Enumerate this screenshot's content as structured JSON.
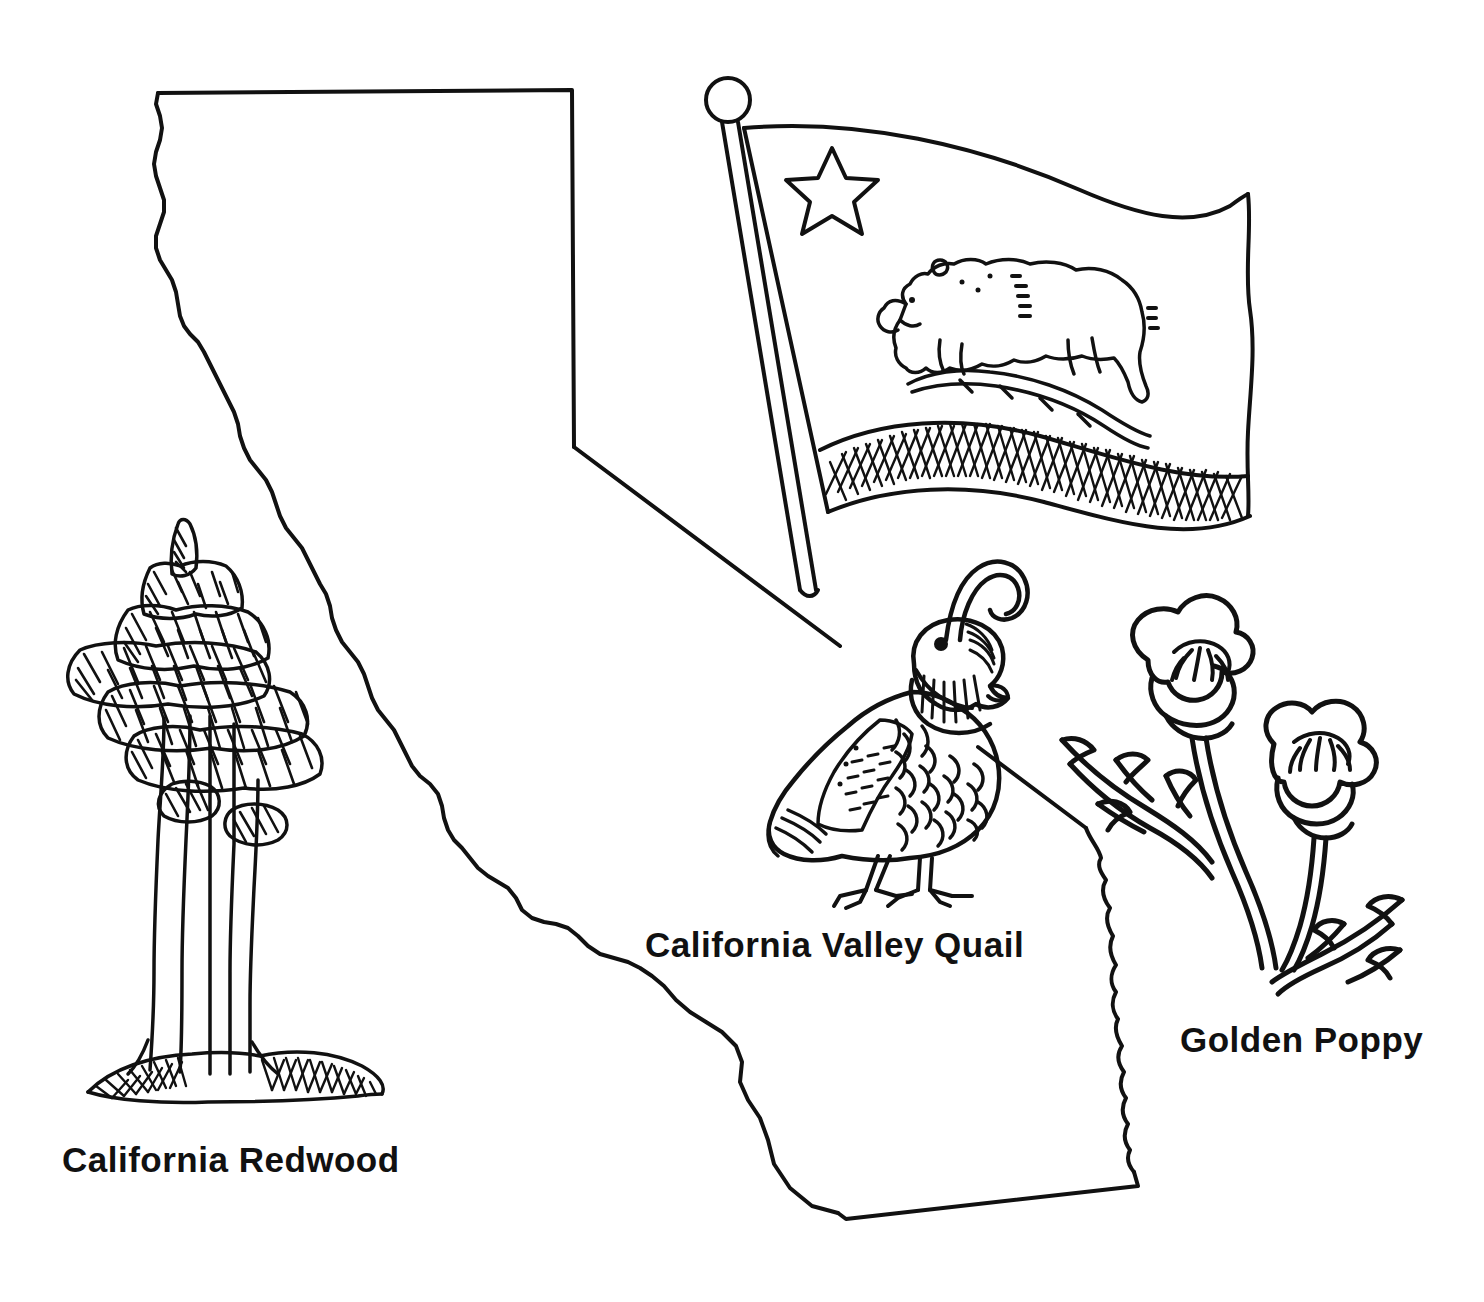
{
  "page": {
    "background_color": "#ffffff",
    "ink_color": "#111111",
    "width": 1484,
    "height": 1302,
    "style": "black-and-white line art / coloring page"
  },
  "map": {
    "state_name": "California",
    "outline_description": "Outline of the state of California with straight northern border, vertical eastern border, diagonal Nevada border, jagged Colorado River eastern edge, angled southern border and wavy Pacific coastline",
    "stroke_color": "#111111"
  },
  "labels": {
    "redwood": "California Redwood",
    "quail": "California Valley Quail",
    "poppy": "Golden Poppy"
  },
  "symbols": [
    {
      "id": "state-flag",
      "name": "California State Flag",
      "elements": [
        "flagpole",
        "finial-ball",
        "star",
        "grizzly-bear",
        "grass-mound",
        "hatched-bottom-stripe"
      ]
    },
    {
      "id": "state-bird",
      "name": "California Valley Quail",
      "label": "California Valley Quail",
      "elements": [
        "topknot-plume",
        "head",
        "eye",
        "beak",
        "striped-throat",
        "wing",
        "scalloped-belly",
        "tail",
        "legs",
        "feet"
      ]
    },
    {
      "id": "state-flower",
      "name": "Golden Poppy",
      "label": "Golden Poppy",
      "elements": [
        "upper-bloom",
        "lower-bloom",
        "stamens",
        "stems",
        "feathery-leaves"
      ]
    },
    {
      "id": "state-tree",
      "name": "California Redwood",
      "label": "California Redwood",
      "elements": [
        "layered-foliage-tiers",
        "fluted-trunk",
        "hatched-ground-mound"
      ]
    }
  ]
}
